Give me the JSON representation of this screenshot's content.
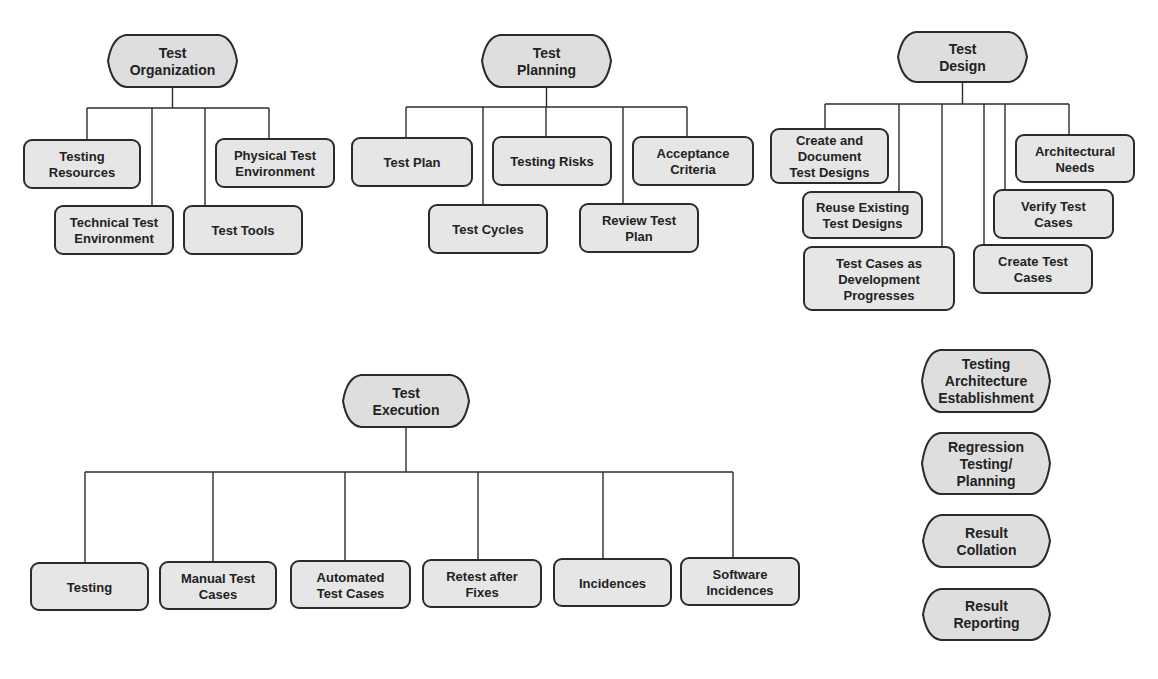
{
  "diagram": {
    "colors": {
      "stroke": "#2b2b2b",
      "box_fill": "#e6e6e6",
      "hex_fill": "#dedede",
      "text": "#222222"
    },
    "groups": [
      {
        "id": "test-organization",
        "root": {
          "lines": [
            "Test",
            "Organization"
          ],
          "x": 108,
          "y": 35,
          "w": 129,
          "h": 52
        },
        "bus_y": 108,
        "children": [
          {
            "lines": [
              "Testing",
              "Resources"
            ],
            "x": 24,
            "y": 140,
            "w": 116,
            "h": 48,
            "drop_x": 87
          },
          {
            "lines": [
              "Technical Test",
              "Environment"
            ],
            "x": 55,
            "y": 206,
            "w": 118,
            "h": 48,
            "drop_x": 152
          },
          {
            "lines": [
              "Test Tools"
            ],
            "x": 184,
            "y": 206,
            "w": 118,
            "h": 48,
            "drop_x": 205
          },
          {
            "lines": [
              "Physical Test",
              "Environment"
            ],
            "x": 216,
            "y": 139,
            "w": 118,
            "h": 48,
            "drop_x": 269
          }
        ]
      },
      {
        "id": "test-planning",
        "root": {
          "lines": [
            "Test",
            "Planning"
          ],
          "x": 482,
          "y": 35,
          "w": 129,
          "h": 52
        },
        "bus_y": 107,
        "children": [
          {
            "lines": [
              "Test Plan"
            ],
            "x": 352,
            "y": 138,
            "w": 120,
            "h": 48,
            "drop_x": 406
          },
          {
            "lines": [
              "Test Cycles"
            ],
            "x": 429,
            "y": 205,
            "w": 118,
            "h": 48,
            "drop_x": 483
          },
          {
            "lines": [
              "Testing Risks"
            ],
            "x": 493,
            "y": 137,
            "w": 118,
            "h": 48,
            "drop_x": 546
          },
          {
            "lines": [
              "Review Test",
              "Plan"
            ],
            "x": 580,
            "y": 204,
            "w": 118,
            "h": 48,
            "drop_x": 623
          },
          {
            "lines": [
              "Acceptance",
              "Criteria"
            ],
            "x": 633,
            "y": 137,
            "w": 120,
            "h": 48,
            "drop_x": 687
          }
        ]
      },
      {
        "id": "test-design",
        "root": {
          "lines": [
            "Test",
            "Design"
          ],
          "x": 898,
          "y": 32,
          "w": 129,
          "h": 50
        },
        "bus_y": 104,
        "children": [
          {
            "lines": [
              "Create and",
              "Document",
              "Test Designs"
            ],
            "x": 771,
            "y": 129,
            "w": 117,
            "h": 54,
            "drop_x": 825
          },
          {
            "lines": [
              "Reuse Existing",
              "Test Designs"
            ],
            "x": 803,
            "y": 192,
            "w": 119,
            "h": 46,
            "drop_x": 899
          },
          {
            "lines": [
              "Test Cases as",
              "Development",
              "Progresses"
            ],
            "x": 804,
            "y": 247,
            "w": 150,
            "h": 63,
            "drop_x": 942
          },
          {
            "lines": [
              "Create Test",
              "Cases"
            ],
            "x": 974,
            "y": 245,
            "w": 118,
            "h": 48,
            "drop_x": 984
          },
          {
            "lines": [
              "Verify Test",
              "Cases"
            ],
            "x": 994,
            "y": 190,
            "w": 119,
            "h": 48,
            "drop_x": 1005
          },
          {
            "lines": [
              "Architectural",
              "Needs"
            ],
            "x": 1016,
            "y": 135,
            "w": 118,
            "h": 47,
            "drop_x": 1069
          }
        ]
      },
      {
        "id": "test-execution",
        "root": {
          "lines": [
            "Test",
            "Execution"
          ],
          "x": 343,
          "y": 375,
          "w": 126,
          "h": 52
        },
        "bus_y": 472,
        "children": [
          {
            "lines": [
              "Testing"
            ],
            "x": 31,
            "y": 563,
            "w": 117,
            "h": 47,
            "drop_x": 85
          },
          {
            "lines": [
              "Manual Test",
              "Cases"
            ],
            "x": 160,
            "y": 562,
            "w": 116,
            "h": 47,
            "drop_x": 213
          },
          {
            "lines": [
              "Automated",
              "Test Cases"
            ],
            "x": 291,
            "y": 561,
            "w": 119,
            "h": 47,
            "drop_x": 345
          },
          {
            "lines": [
              "Retest after",
              "Fixes"
            ],
            "x": 423,
            "y": 560,
            "w": 118,
            "h": 47,
            "drop_x": 478
          },
          {
            "lines": [
              "Incidences"
            ],
            "x": 554,
            "y": 559,
            "w": 117,
            "h": 47,
            "drop_x": 603
          },
          {
            "lines": [
              "Software",
              "Incidences"
            ],
            "x": 681,
            "y": 558,
            "w": 118,
            "h": 47,
            "drop_x": 733
          }
        ]
      }
    ],
    "standalone": [
      {
        "id": "testing-architecture-establishment",
        "lines": [
          "Testing",
          "Architecture",
          "Establishment"
        ],
        "x": 922,
        "y": 350,
        "w": 128,
        "h": 62
      },
      {
        "id": "regression-testing-planning",
        "lines": [
          "Regression",
          "Testing/",
          "Planning"
        ],
        "x": 922,
        "y": 433,
        "w": 128,
        "h": 61
      },
      {
        "id": "result-collation",
        "lines": [
          "Result",
          "Collation"
        ],
        "x": 923,
        "y": 515,
        "w": 127,
        "h": 52
      },
      {
        "id": "result-reporting",
        "lines": [
          "Result",
          "Reporting"
        ],
        "x": 923,
        "y": 589,
        "w": 127,
        "h": 51
      }
    ]
  }
}
